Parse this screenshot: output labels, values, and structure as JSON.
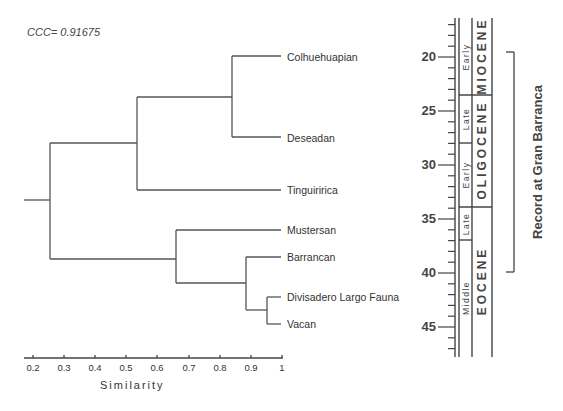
{
  "ccc_label": "CCC= 0.91675",
  "chart_data": {
    "type": "dendrogram",
    "title": "",
    "annotation": "CCC= 0.91675",
    "xlabel": "Similarity",
    "xlim": [
      0.17,
      1.0
    ],
    "xticks": [
      "0.2",
      "0.3",
      "0.4",
      "0.5",
      "0.6",
      "0.7",
      "0.8",
      "0.9",
      "1"
    ],
    "leaves": [
      "Colhuehuapian",
      "Deseadan",
      "Tinguiririca",
      "Mustersan",
      "Barrancan",
      "Divisadero Largo Fauna",
      "Vacan"
    ],
    "clusters": [
      {
        "members": [
          "Divisadero Largo Fauna",
          "Vacan"
        ],
        "similarity": 0.95
      },
      {
        "members": [
          "Barrancan",
          "Divisadero Largo Fauna",
          "Vacan"
        ],
        "similarity": 0.885
      },
      {
        "members": [
          "Colhuehuapian",
          "Deseadan"
        ],
        "similarity": 0.84
      },
      {
        "members": [
          "Mustersan",
          "Barrancan",
          "Divisadero Largo Fauna",
          "Vacan"
        ],
        "similarity": 0.66
      },
      {
        "members": [
          "Colhuehuapian",
          "Deseadan",
          "Tinguiririca"
        ],
        "similarity": 0.535
      },
      {
        "members": [
          "all"
        ],
        "similarity": 0.255
      }
    ],
    "timescale": {
      "ylabel": "Ma",
      "yticks": [
        "20",
        "25",
        "30",
        "35",
        "40",
        "45"
      ],
      "ylim": [
        17,
        47.5
      ],
      "epochs": [
        {
          "name": "MIOCENE",
          "from": 17.5,
          "to": 23
        },
        {
          "name": "OLIGOCENE",
          "from": 23,
          "to": 33.9
        },
        {
          "name": "EOCENE",
          "from": 33.9,
          "to": 47.5
        }
      ],
      "subepochs": [
        {
          "name": "Early",
          "from": 17.5,
          "to": 23
        },
        {
          "name": "Late",
          "from": 23,
          "to": 28
        },
        {
          "name": "Early",
          "from": 28,
          "to": 33.9
        },
        {
          "name": "Late",
          "from": 33.9,
          "to": 37
        },
        {
          "name": "Middle",
          "from": 37,
          "to": 47.5
        }
      ]
    },
    "bracket": {
      "label": "Record at Gran Barranca",
      "from": 19.5,
      "to": 39.8
    }
  },
  "leaves": [
    {
      "label": "Colhuehuapian",
      "y": 51
    },
    {
      "label": "Deseadan",
      "y": 132
    },
    {
      "label": "Tinguiririca",
      "y": 184
    },
    {
      "label": "Mustersan",
      "y": 224
    },
    {
      "label": "Barrancan",
      "y": 251
    },
    {
      "label": "Divisadero Largo Fauna",
      "y": 291
    },
    {
      "label": "Vacan",
      "y": 318
    }
  ],
  "xticks": [
    {
      "label": "0.2",
      "x": 33
    },
    {
      "label": "0.3",
      "x": 64
    },
    {
      "label": "0.4",
      "x": 95
    },
    {
      "label": "0.5",
      "x": 126
    },
    {
      "label": "0.6",
      "x": 157
    },
    {
      "label": "0.7",
      "x": 189
    },
    {
      "label": "0.8",
      "x": 220
    },
    {
      "label": "0.9",
      "x": 251
    },
    {
      "label": "1",
      "x": 282
    }
  ],
  "xlabel": "Similarity",
  "yticks": [
    {
      "label": "20",
      "y": 50
    },
    {
      "label": "25",
      "y": 104
    },
    {
      "label": "30",
      "y": 158
    },
    {
      "label": "35",
      "y": 212
    },
    {
      "label": "40",
      "y": 266
    },
    {
      "label": "45",
      "y": 320
    }
  ],
  "subepochs": [
    {
      "label": "Early",
      "cy": 57
    },
    {
      "label": "Late",
      "cy": 119
    },
    {
      "label": "Early",
      "cy": 175
    },
    {
      "label": "Late",
      "cy": 224
    },
    {
      "label": "Middle",
      "cy": 298
    }
  ],
  "epochs": [
    {
      "label": "MIOCENE",
      "cy": 56
    },
    {
      "label": "OLIGOCENE",
      "cy": 150
    },
    {
      "label": "EOCENE",
      "cy": 281
    }
  ],
  "record_label": "Record at Gran Barranca"
}
